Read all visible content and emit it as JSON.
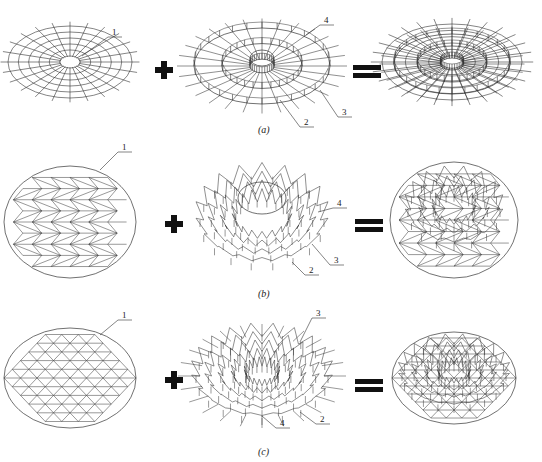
{
  "rows": [
    {
      "caption": "(a)",
      "labels": {
        "l1": "1",
        "l2": "2",
        "l3": "3",
        "l4": "4"
      }
    },
    {
      "caption": "(b)",
      "labels": {
        "l1": "1",
        "l2": "2",
        "l3": "3",
        "l4": "4"
      }
    },
    {
      "caption": "(c)",
      "labels": {
        "l1": "1",
        "l2": "2",
        "l3": "3",
        "l4": "4"
      }
    }
  ],
  "operators": {
    "plus": "+",
    "equals": "="
  },
  "colors": {
    "line": "#333333",
    "operator": "#111111"
  }
}
